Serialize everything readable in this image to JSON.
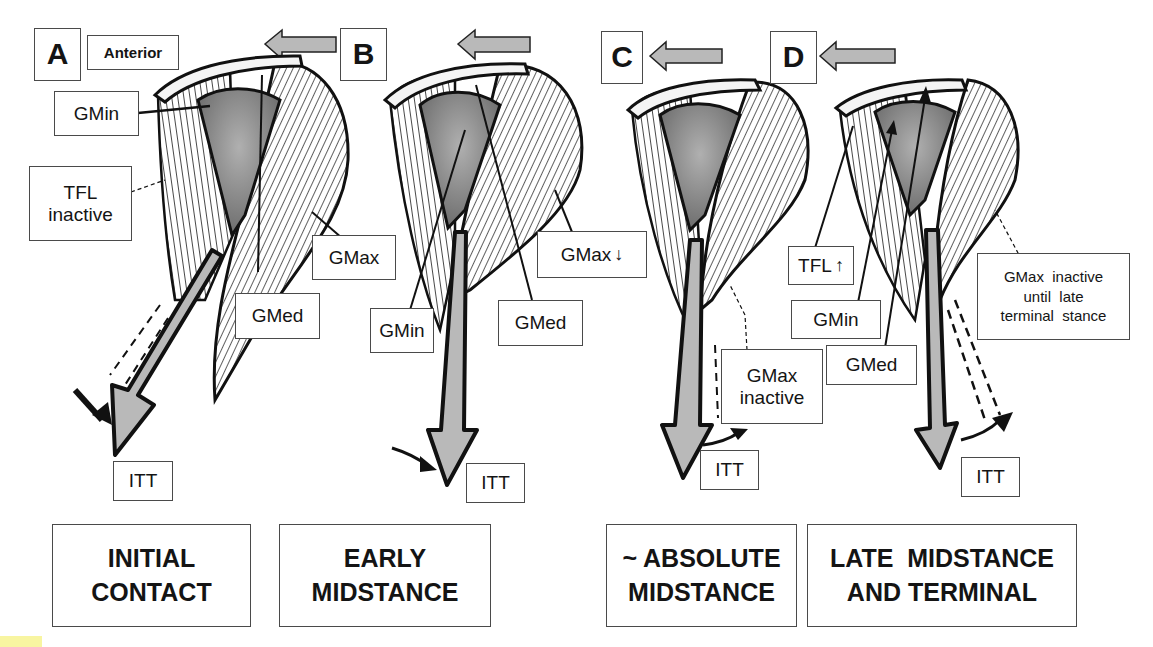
{
  "figure": {
    "type": "anatomical diagram",
    "panels": [
      {
        "letter": "A",
        "orientation_label": "Anterior",
        "phase_label_line1": "INITIAL",
        "phase_label_line2": "CONTACT",
        "labels": {
          "gmin": "GMin",
          "tfl": "TFL inactive",
          "tfl_line1": "TFL",
          "tfl_line2": "inactive",
          "gmax": "GMax",
          "gmed": "GMed",
          "itt": "ITT"
        }
      },
      {
        "letter": "B",
        "phase_label_line1": "EARLY",
        "phase_label_line2": "MIDSTANCE",
        "labels": {
          "gmax": "GMax",
          "gmax_indicator": "↓",
          "gmin": "GMin",
          "gmed": "GMed",
          "itt": "ITT"
        }
      },
      {
        "letter": "C",
        "phase_label_line1": "~ ABSOLUTE",
        "phase_label_line2": "MIDSTANCE",
        "labels": {
          "gmax_line1": "GMax",
          "gmax_line2": "inactive",
          "itt": "ITT"
        }
      },
      {
        "letter": "D",
        "phase_label_line1": "LATE  MIDSTANCE",
        "phase_label_line2": "AND TERMINAL",
        "labels": {
          "tfl": "TFL",
          "tfl_indicator": "↑",
          "gmin": "GMin",
          "gmed": "GMed",
          "gmax_line1": "GMax  inactive",
          "gmax_line2": "until  late",
          "gmax_line3": "terminal  stance",
          "itt": "ITT"
        }
      }
    ],
    "colors": {
      "ink": "#141414",
      "arrow_fill": "#b9b9b9",
      "bone_fill": "#8e8e8e",
      "box_border": "#4a4a4a",
      "background": "#ffffff"
    }
  }
}
